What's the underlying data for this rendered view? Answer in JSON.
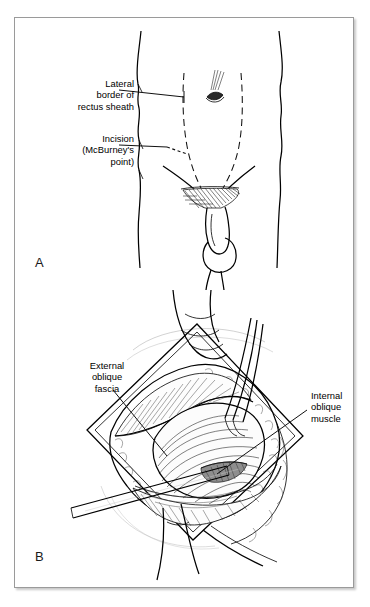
{
  "figure": {
    "kind": "two-panel surgical anatomical illustration",
    "background_color": "#ffffff",
    "frame_color": "#9a9a9a",
    "ink_color": "#000000"
  },
  "panels": [
    {
      "letter": "A",
      "caption_subject": "Anterior abdominal wall surface landmarks",
      "labels": [
        {
          "id": "lateral-border",
          "text": "Lateral\nborder of\nrectus sheath",
          "align": "right",
          "leader": "horizontal line to dashed rectus sheath border"
        },
        {
          "id": "incision",
          "text": "Incision\n(McBurney's\npoint)",
          "align": "right",
          "leader": "horizontal line to short dashed oblique incision mark"
        }
      ]
    },
    {
      "letter": "B",
      "caption_subject": "Operative exposure of the oblique muscle layers",
      "labels": [
        {
          "id": "external-oblique-fascia",
          "text": "External\noblique\nfascia",
          "align": "center",
          "leader": "diagonal line down-right into fascial layer"
        },
        {
          "id": "internal-oblique-muscle",
          "text": "Internal\noblique\nmuscle",
          "align": "left",
          "leader": "diagonal line down-left into muscle belly"
        }
      ]
    }
  ]
}
